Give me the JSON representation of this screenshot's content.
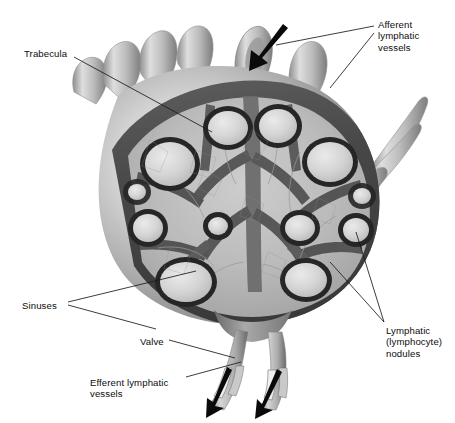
{
  "figure": {
    "style": "grayscale-airbrush-anatomical-illustration",
    "width": 455,
    "height": 423
  },
  "labels": {
    "trabecula": "Trabecula",
    "afferent": "Afferent\nlymphatic\nvessels",
    "sinuses": "Sinuses",
    "valve": "Valve",
    "efferent": "Efferent lymphatic\nvessels",
    "nodules": "Lymphatic\n(lymphocyte)\nnodules"
  },
  "colors": {
    "background": "#ffffff",
    "text": "#0d0d0d",
    "leader_line": "#1a1a1a",
    "capsule_outer_light": "#e8e8e8",
    "capsule_outer_mid": "#b4b4b4",
    "capsule_outer_dark": "#8c8c8c",
    "capsule_rim": "#4a4a4a",
    "medulla": "#b9b9b9",
    "trabecula_dark": "#5a5a5a",
    "nodule_fill": "#d9d9d9",
    "nodule_rim": "#262626",
    "vessel_light": "#dcdcdc",
    "vessel_mid": "#a8a8a8",
    "vessel_shadow": "#6e6e6e",
    "arrow": "#0a0a0a"
  },
  "structures": {
    "capsule": "outer connective tissue capsule, intact on the left, cut away on the right to reveal interior",
    "afferent_vessels_top": "several vessel stumps projecting from the upper capsule surface carrying lymph into the node",
    "afferent_arrow_direction": "into node, down-left",
    "efferent_vessels_bottom": "two vessels leaving the hilum, cut open to show internal valves",
    "efferent_arrow_direction": "out of node, down-left",
    "nodules_count": 12,
    "nodule_description": "pale lymphatic nodules each ringed by a dark cortical band",
    "sinuses_description": "lighter channels between nodules and trabeculae where lymph percolates",
    "trabeculae_description": "dark partitions extending inward from the capsule"
  },
  "leaders": {
    "trabecula": [
      {
        "x1": 74,
        "y1": 57,
        "x2": 212,
        "y2": 132
      }
    ],
    "afferent": [
      {
        "x1": 374,
        "y1": 26,
        "x2": 276,
        "y2": 45
      },
      {
        "x1": 374,
        "y1": 33,
        "x2": 330,
        "y2": 88
      }
    ],
    "sinuses": [
      {
        "x1": 68,
        "y1": 302,
        "x2": 196,
        "y2": 271
      },
      {
        "x1": 68,
        "y1": 305,
        "x2": 156,
        "y2": 329
      }
    ],
    "valve": [
      {
        "x1": 169,
        "y1": 340,
        "x2": 235,
        "y2": 358
      }
    ],
    "efferent": [
      {
        "x1": 186,
        "y1": 377,
        "x2": 241,
        "y2": 362
      }
    ],
    "nodules": [
      {
        "x1": 384,
        "y1": 322,
        "x2": 330,
        "y2": 262
      },
      {
        "x1": 384,
        "y1": 322,
        "x2": 356,
        "y2": 232
      }
    ]
  }
}
